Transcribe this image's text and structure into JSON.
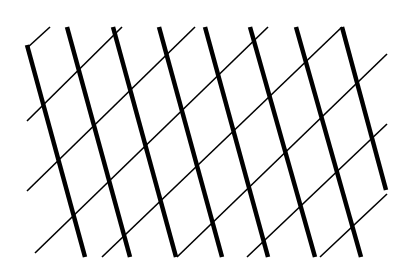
{
  "pattern": {
    "description": "Lattice of thick parallel lines crossed by thin diagonal lines",
    "width": 406,
    "height": 270,
    "background_color": "#ffffff",
    "line_color": "#000000",
    "thick_stroke_width": 4.5,
    "thin_stroke_width": 1.6,
    "thick_lines": [
      {
        "x1": 27,
        "y1": 45,
        "x2": 85,
        "y2": 257
      },
      {
        "x1": 67,
        "y1": 27,
        "x2": 130,
        "y2": 257
      },
      {
        "x1": 113,
        "y1": 27,
        "x2": 176,
        "y2": 257
      },
      {
        "x1": 159,
        "y1": 27,
        "x2": 222,
        "y2": 257
      },
      {
        "x1": 205,
        "y1": 27,
        "x2": 268,
        "y2": 257
      },
      {
        "x1": 250,
        "y1": 27,
        "x2": 315,
        "y2": 257
      },
      {
        "x1": 296,
        "y1": 27,
        "x2": 361,
        "y2": 257
      },
      {
        "x1": 342,
        "y1": 27,
        "x2": 386,
        "y2": 190
      }
    ],
    "thin_lines": [
      {
        "x1": 27,
        "y1": 48,
        "x2": 50,
        "y2": 27
      },
      {
        "x1": 27,
        "y1": 121,
        "x2": 122,
        "y2": 27
      },
      {
        "x1": 27,
        "y1": 191,
        "x2": 195,
        "y2": 27
      },
      {
        "x1": 35,
        "y1": 253,
        "x2": 268,
        "y2": 27
      },
      {
        "x1": 102,
        "y1": 257,
        "x2": 342,
        "y2": 27
      },
      {
        "x1": 177,
        "y1": 257,
        "x2": 387,
        "y2": 54
      },
      {
        "x1": 247,
        "y1": 257,
        "x2": 387,
        "y2": 124
      },
      {
        "x1": 320,
        "y1": 257,
        "x2": 387,
        "y2": 194
      }
    ]
  }
}
